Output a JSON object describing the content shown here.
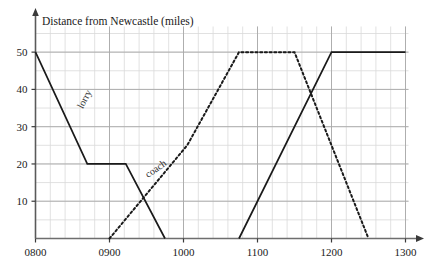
{
  "chart_data": {
    "type": "line",
    "title": "Distance from Newcastle (miles)",
    "xlabel": "",
    "ylabel": "Distance from Newcastle (miles)",
    "xlim": [
      800,
      1300
    ],
    "ylim": [
      0,
      55
    ],
    "grid": true,
    "grid_major_x_step": 100,
    "grid_minor_x_step": 20,
    "grid_major_y_step": 10,
    "grid_minor_y_step": 5,
    "x_tick_labels": [
      "0800",
      "0900",
      "1000",
      "1100",
      "1200",
      "1300"
    ],
    "x_tick_values": [
      800,
      900,
      1000,
      1100,
      1200,
      1300
    ],
    "y_tick_labels": [
      "10",
      "20",
      "30",
      "40",
      "50"
    ],
    "y_tick_values": [
      10,
      20,
      30,
      40,
      50
    ],
    "legend_position": "inline-annotation",
    "series": [
      {
        "name": "lorry",
        "style": "solid",
        "color": "#1a1a1a",
        "label": "lorry",
        "label_rotation": -62,
        "label_x": 870,
        "label_y": 37,
        "points": [
          {
            "x": 800,
            "y": 50
          },
          {
            "x": 870,
            "y": 20
          },
          {
            "x": 922,
            "y": 20
          },
          {
            "x": 975,
            "y": 0
          }
        ]
      },
      {
        "name": "lorry-return",
        "style": "solid",
        "color": "#1a1a1a",
        "label": "",
        "points": [
          {
            "x": 1075,
            "y": 0
          },
          {
            "x": 1200,
            "y": 50
          },
          {
            "x": 1300,
            "y": 50
          }
        ]
      },
      {
        "name": "coach",
        "style": "dotted",
        "color": "#1a1a1a",
        "label": "coach",
        "label_rotation": -35,
        "label_x": 965,
        "label_y": 18,
        "points": [
          {
            "x": 900,
            "y": 0
          },
          {
            "x": 1005,
            "y": 25
          },
          {
            "x": 1075,
            "y": 50
          },
          {
            "x": 1150,
            "y": 50
          },
          {
            "x": 1250,
            "y": 0
          }
        ]
      }
    ],
    "annotations": [
      {
        "name": "lorry-label",
        "text": "lorry"
      },
      {
        "name": "coach-label",
        "text": "coach"
      }
    ]
  }
}
